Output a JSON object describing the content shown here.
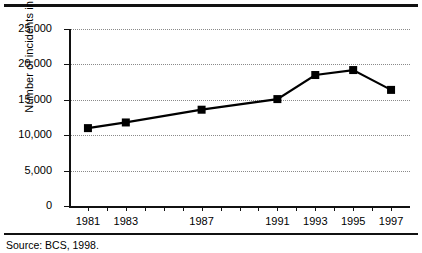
{
  "figure": {
    "source_note": "Source: BCS, 1998."
  },
  "chart_data": {
    "type": "line",
    "title": "",
    "xlabel": "",
    "ylabel": "Number of incidents in '000s",
    "x": [
      1981,
      1983,
      1987,
      1991,
      1993,
      1995,
      1997
    ],
    "categories": [
      "1981",
      "1983",
      "1987",
      "1991",
      "1993",
      "1995",
      "1997"
    ],
    "values": [
      11000,
      11800,
      13600,
      15100,
      18500,
      19200,
      16400
    ],
    "series": [
      {
        "name": "Number of incidents",
        "values": [
          11000,
          11800,
          13600,
          15100,
          18500,
          19200,
          16400
        ]
      }
    ],
    "xlim": [
      1980,
      1998
    ],
    "ylim": [
      0,
      25000
    ],
    "yticks": [
      0,
      5000,
      10000,
      15000,
      20000,
      25000
    ],
    "ytick_labels": [
      "0",
      "5,000",
      "10,000",
      "15,000",
      "20,000",
      "25,000"
    ],
    "xticks": [
      1981,
      1982,
      1983,
      1984,
      1985,
      1986,
      1987,
      1988,
      1989,
      1990,
      1991,
      1992,
      1993,
      1994,
      1995,
      1996,
      1997
    ],
    "xtick_labels": [
      "1981",
      "1983",
      "1987",
      "1991",
      "1993",
      "1995",
      "1997"
    ],
    "grid": "horizontal-dotted",
    "legend": "none",
    "marker": "filled-square",
    "line_color": "#000000",
    "marker_color": "#000000",
    "grid_color": "#8a8a8a"
  }
}
